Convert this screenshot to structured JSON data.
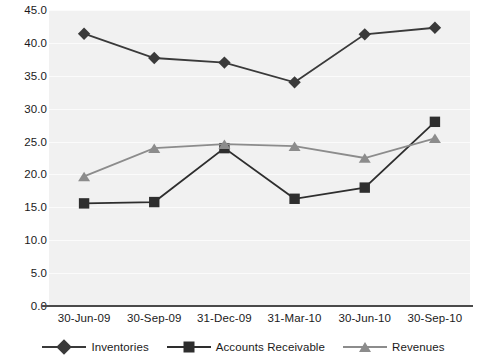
{
  "chart_data": {
    "type": "line",
    "title": "",
    "xlabel": "",
    "ylabel": "",
    "categories": [
      "30-Jun-09",
      "30-Sep-09",
      "31-Dec-09",
      "31-Mar-10",
      "30-Jun-10",
      "30-Sep-10"
    ],
    "ylim": [
      0.0,
      45.0
    ],
    "yticks": [
      "0.0",
      "5.0",
      "10.0",
      "15.0",
      "20.0",
      "25.0",
      "30.0",
      "35.0",
      "40.0",
      "45.0"
    ],
    "ytick_values": [
      0.0,
      5.0,
      10.0,
      15.0,
      20.0,
      25.0,
      30.0,
      35.0,
      40.0,
      45.0
    ],
    "grid": true,
    "legend_position": "bottom",
    "series": [
      {
        "name": "Inventories",
        "marker": "diamond",
        "color": "#3a3a3a",
        "values": [
          41.4,
          37.7,
          37.0,
          34.0,
          41.3,
          42.3
        ]
      },
      {
        "name": "Accounts Receivable",
        "marker": "square",
        "color": "#2e2e2e",
        "values": [
          15.6,
          15.8,
          24.0,
          16.3,
          18.0,
          28.0
        ]
      },
      {
        "name": "Revenues",
        "marker": "triangle",
        "color": "#8c8c8c",
        "values": [
          19.7,
          24.0,
          24.6,
          24.3,
          22.5,
          25.5
        ]
      }
    ]
  },
  "colors": {
    "plot_background": "#f1f1f1",
    "page_background": "#ffffff",
    "gridline": "#fbfbfb",
    "axis": "#4a4a4a",
    "text": "#1a1a1a",
    "inventories": "#3a3a3a",
    "accounts_receivable": "#2e2e2e",
    "revenues": "#8c8c8c"
  },
  "legend": {
    "items": [
      {
        "label": "Inventories",
        "marker": "diamond-marker-icon"
      },
      {
        "label": "Accounts Receivable",
        "marker": "square-marker-icon"
      },
      {
        "label": "Revenues",
        "marker": "triangle-marker-icon"
      }
    ]
  }
}
